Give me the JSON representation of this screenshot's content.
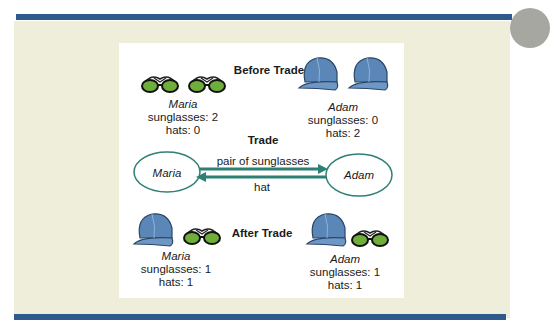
{
  "sections": {
    "before": {
      "title": "Before Trade",
      "maria": {
        "name": "Maria",
        "sunglasses": "sunglasses: 2",
        "hats": "hats: 0"
      },
      "adam": {
        "name": "Adam",
        "sunglasses": "sunglasses: 0",
        "hats": "hats: 2"
      }
    },
    "trade": {
      "title": "Trade",
      "maria_node": "Maria",
      "adam_node": "Adam",
      "forward_label": "pair of sunglasses",
      "backward_label": "hat"
    },
    "after": {
      "title": "After Trade",
      "maria": {
        "name": "Maria",
        "sunglasses": "sunglasses: 1",
        "hats": "hats: 1"
      },
      "adam": {
        "name": "Adam",
        "sunglasses": "sunglasses: 1",
        "hats": "hats: 1"
      }
    }
  },
  "colors": {
    "bar": "#2e5b8c",
    "panel": "#eeeedb",
    "arrow": "#2e8075",
    "lens": "#6fae3a",
    "cap": "#5b86b8"
  }
}
